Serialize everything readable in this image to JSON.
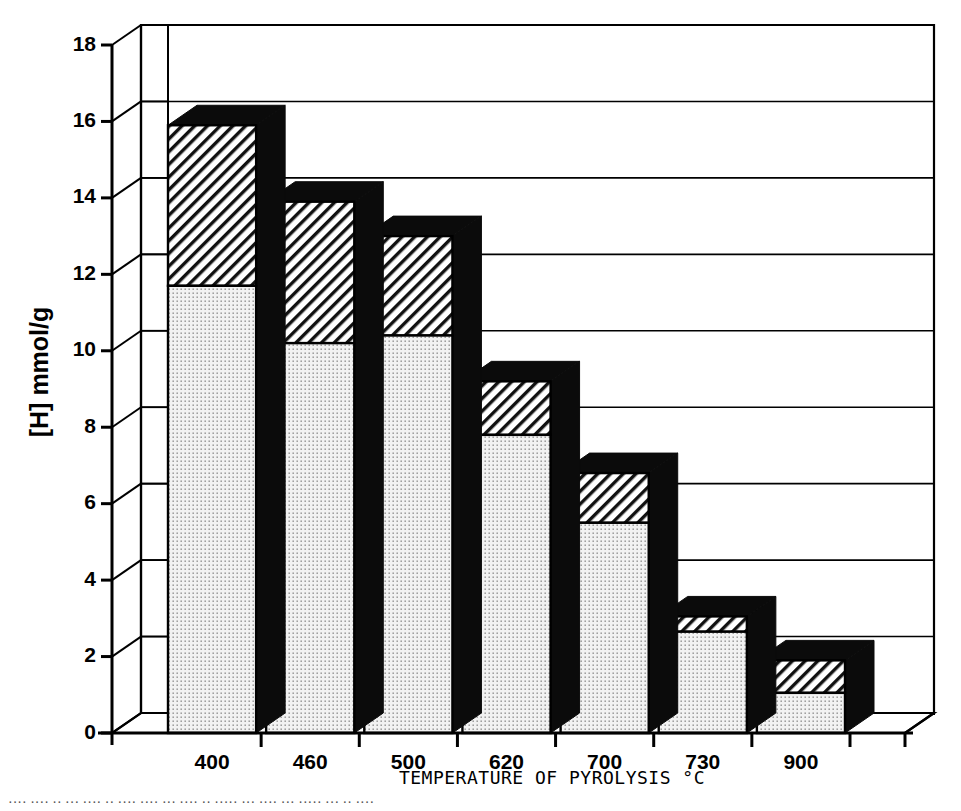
{
  "figure": {
    "background": "#ffffff",
    "ink_color": "#000000"
  },
  "chart_data": {
    "type": "bar",
    "title": "",
    "subtitle": "",
    "xlabel": "TEMPERATURE OF PYROLYSIS °C",
    "ylabel": "[H] mmol/g",
    "categories": [
      "400",
      "460",
      "500",
      "620",
      "700",
      "730",
      "900"
    ],
    "ylim": [
      0,
      18
    ],
    "ytick_values": [
      0,
      2,
      4,
      6,
      8,
      10,
      12,
      14,
      16,
      18
    ],
    "ytick_labels": [
      "0",
      "2",
      "4",
      "6",
      "8",
      "10",
      "12",
      "14",
      "16",
      "18"
    ],
    "grid": "horizontal-gridlines-on-back-wall",
    "legend": "none",
    "style": "3d-stacked-bar-isometric",
    "stacked": true,
    "series": [
      {
        "name": "lower-segment-stippled",
        "pattern": "dotted-stipple",
        "color": "#eeeeee",
        "values": [
          11.7,
          10.2,
          10.4,
          7.8,
          5.5,
          2.65,
          1.05
        ]
      },
      {
        "name": "upper-segment-hatched",
        "pattern": "diagonal-hatch",
        "color": "#ffffff",
        "values": [
          4.2,
          3.7,
          2.6,
          1.4,
          1.3,
          0.4,
          0.85
        ]
      }
    ],
    "totals": [
      15.9,
      13.9,
      13.0,
      9.2,
      6.8,
      3.05,
      1.9
    ],
    "annotations": []
  },
  "axes": {
    "y_axis_name": "y-axis",
    "x_axis_name": "x-axis"
  },
  "caption": {
    "text": "···· ···· ·· ··· ···· ·· ···· ···· ··· ···· ·· ····· ··· ···· ··· ····· ··· ·· ····"
  }
}
